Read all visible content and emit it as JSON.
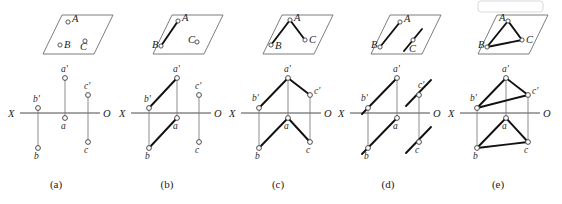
{
  "figure": {
    "background_color": "#ffffff",
    "line_color": "#111111",
    "thin_line_color": "#7a7a7a",
    "plane_color": "#6e6e6e",
    "axis_labels": {
      "left": "X",
      "right": "O"
    },
    "point_labels_space": {
      "a": "A",
      "b": "B",
      "c": "C"
    },
    "point_labels_vertical": {
      "a": "a'",
      "b": "b'",
      "c": "c'"
    },
    "point_labels_horizontal": {
      "a": "a",
      "b": "b",
      "c": "c"
    }
  },
  "panels": [
    {
      "id": "a",
      "caption": "(a)",
      "description": "Three isolated points A, B, C shown on an oblique plane with their two orthographic projections; no connecting lines drawn.",
      "space_points": [
        {
          "name": "A",
          "label": "A",
          "label_side": "right"
        },
        {
          "name": "B",
          "label": "B",
          "label_side": "right"
        },
        {
          "name": "C",
          "label": "C",
          "label_side": "below"
        }
      ],
      "space_segments": [],
      "projection_segments": []
    },
    {
      "id": "b",
      "caption": "(b)",
      "description": "Segment AB drawn in space and both of its projections a'b' and ab drawn; point C still isolated.",
      "space_points": [
        {
          "name": "A",
          "label": "A",
          "label_side": "right"
        },
        {
          "name": "B",
          "label": "B",
          "label_side": "right"
        },
        {
          "name": "C",
          "label": "C",
          "label_side": "left"
        }
      ],
      "space_segments": [
        "A-B"
      ],
      "projection_segments": [
        "a'-b'",
        "a-b"
      ]
    },
    {
      "id": "c",
      "caption": "(c)",
      "description": "Open polyline B-A-C drawn in space; projections b'-a'-c' and b-a-c drawn as open paths.",
      "space_points": [
        {
          "name": "A",
          "label": "A",
          "label_side": "right"
        },
        {
          "name": "B",
          "label": "B",
          "label_side": "right"
        },
        {
          "name": "C",
          "label": "C",
          "label_side": "right"
        }
      ],
      "space_segments": [
        "A-B",
        "A-C"
      ],
      "projection_segments": [
        "a'-b'",
        "a'-c'",
        "a-b",
        "a-c"
      ]
    },
    {
      "id": "d",
      "caption": "(d)",
      "description": "Segment AB and a second short segment through C drawn parallel to AB; projections show parallel pairs of lines rather than a closed figure.",
      "space_points": [
        {
          "name": "A",
          "label": "A",
          "label_side": "right"
        },
        {
          "name": "B",
          "label": "B",
          "label_side": "right"
        },
        {
          "name": "C",
          "label": "C",
          "label_side": "below"
        }
      ],
      "space_segments": [
        "A-B",
        "C-parallel"
      ],
      "projection_segments": [
        "a'-b'-extended",
        "c'-parallel",
        "a-b-extended",
        "c-parallel"
      ]
    },
    {
      "id": "e",
      "caption": "(e)",
      "description": "Closed triangle ABC drawn in space; both projections a'b'c' and abc form closed triangles.",
      "space_points": [
        {
          "name": "A",
          "label": "A",
          "label_side": "left"
        },
        {
          "name": "B",
          "label": "B",
          "label_side": "left"
        },
        {
          "name": "C",
          "label": "C",
          "label_side": "right"
        }
      ],
      "space_segments": [
        "A-B",
        "A-C",
        "B-C"
      ],
      "projection_segments": [
        "a'-b'",
        "a'-c'",
        "b'-c'",
        "a-b",
        "a-c",
        "b-c"
      ]
    }
  ]
}
